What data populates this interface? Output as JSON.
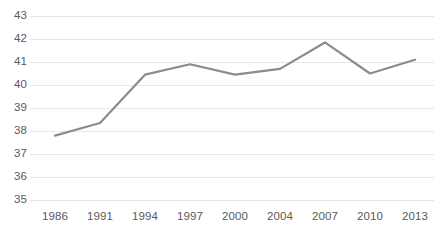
{
  "chart_data": {
    "type": "line",
    "title": "",
    "subtitle": "",
    "xlabel": "",
    "ylabel": "",
    "categories": [
      "1986",
      "1991",
      "1994",
      "1997",
      "2000",
      "2004",
      "2007",
      "2010",
      "2013"
    ],
    "values": [
      37.8,
      38.35,
      40.45,
      40.9,
      40.45,
      40.7,
      41.85,
      40.5,
      41.1
    ],
    "series": [
      {
        "name": "",
        "values": [
          37.8,
          38.35,
          40.45,
          40.9,
          40.45,
          40.7,
          41.85,
          40.5,
          41.1
        ]
      }
    ],
    "ylim": [
      35,
      43
    ],
    "ytick_labels": [
      "43",
      "42",
      "41",
      "40",
      "39",
      "38",
      "37",
      "36",
      "35"
    ],
    "ytick_values": [
      43,
      42,
      41,
      40,
      39,
      38,
      37,
      36,
      35
    ],
    "xtick_labels": [
      "1986",
      "1991",
      "1994",
      "1997",
      "2000",
      "2004",
      "2007",
      "2010",
      "2013"
    ],
    "grid": true,
    "grid_axis": "y",
    "legend": false,
    "legend_position": "none",
    "markers": false,
    "annotations": [],
    "colors": {
      "line": "#8c8c8c",
      "grid": "#e7e7e7",
      "tick_text": "#595959",
      "background": "#ffffff"
    },
    "line_width": 2.2
  }
}
